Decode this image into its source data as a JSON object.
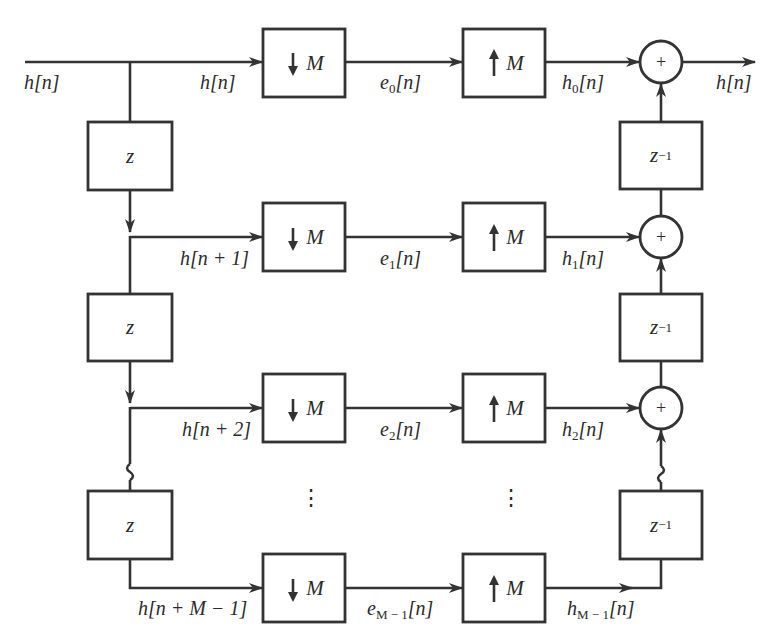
{
  "diagram": {
    "type": "polyphase filter bank block diagram",
    "input_label": "h[n]",
    "output_label": "h[n]",
    "delay_block_label": "z",
    "advance_block_label": "z",
    "reconstruction_delay_label": "z",
    "reconstruction_delay_exp": "−1",
    "downsampler_label": "M",
    "upsampler_label": "M",
    "adder_symbol": "+",
    "ellipsis": "⋮",
    "branches": [
      {
        "input": {
          "base": "h[",
          "arg": "n",
          "tail": "]"
        },
        "input_text": "h[n]",
        "decimated": "e",
        "decimated_sub": "0",
        "decimated_text": "e0[n]",
        "upsampled": "h",
        "upsampled_sub": "0",
        "upsampled_text": "h0[n]"
      },
      {
        "input_text": "h[n + 1]",
        "decimated": "e",
        "decimated_sub": "1",
        "decimated_text": "e1[n]",
        "upsampled": "h",
        "upsampled_sub": "1",
        "upsampled_text": "h1[n]"
      },
      {
        "input_text": "h[n + 2]",
        "decimated": "e",
        "decimated_sub": "2",
        "decimated_text": "e2[n]",
        "upsampled": "h",
        "upsampled_sub": "2",
        "upsampled_text": "h2[n]"
      },
      {
        "input_text": "h[n + M − 1]",
        "decimated": "e",
        "decimated_sub": "M − 1",
        "decimated_text": "eM−1[n]",
        "upsampled": "h",
        "upsampled_sub": "M − 1",
        "upsampled_text": "hM−1[n]"
      }
    ],
    "labels": {
      "in_main": "h[n]",
      "branch0_in": "h[n]",
      "branch1_in": "h[n + 1]",
      "branch2_in": "h[n + 2]",
      "branch3_in": "h[n + M − 1]",
      "n_bracket": "[n]",
      "out_main": "h[n]"
    }
  }
}
